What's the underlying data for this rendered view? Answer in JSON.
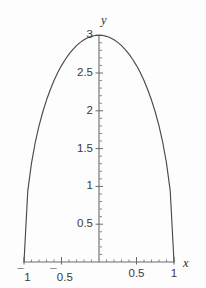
{
  "chart_data": {
    "type": "line",
    "title": "",
    "xlabel": "x",
    "ylabel": "y",
    "xlim": [
      -1,
      1
    ],
    "ylim": [
      0,
      3
    ],
    "grid": false,
    "legend": null,
    "equation": "y = 3*sqrt(1 - x^2)",
    "line_color": "#4a4a4a",
    "axis_color": "#6a6a6a",
    "background_color": "#fdfdfd",
    "x_ticks": [
      {
        "value": -1,
        "label": "1",
        "negative": true
      },
      {
        "value": -0.5,
        "label": "0.5",
        "negative": true
      },
      {
        "value": 0.5,
        "label": "0.5",
        "negative": false
      },
      {
        "value": 1,
        "label": "1",
        "negative": false
      }
    ],
    "y_ticks": [
      {
        "value": 0.5,
        "label": "0.5"
      },
      {
        "value": 1,
        "label": "1"
      },
      {
        "value": 1.5,
        "label": "1.5"
      },
      {
        "value": 2,
        "label": "2"
      },
      {
        "value": 2.5,
        "label": "2.5"
      },
      {
        "value": 3,
        "label": "3"
      }
    ],
    "x_minor_tick_step": 0.1,
    "y_minor_tick_step": 0.1,
    "points": [
      {
        "x": -1.0,
        "y": 0.0
      },
      {
        "x": -0.95,
        "y": 0.937
      },
      {
        "x": -0.9,
        "y": 1.308
      },
      {
        "x": -0.85,
        "y": 1.581
      },
      {
        "x": -0.8,
        "y": 1.8
      },
      {
        "x": -0.75,
        "y": 1.984
      },
      {
        "x": -0.7,
        "y": 2.142
      },
      {
        "x": -0.65,
        "y": 2.279
      },
      {
        "x": -0.6,
        "y": 2.4
      },
      {
        "x": -0.55,
        "y": 2.507
      },
      {
        "x": -0.5,
        "y": 2.598
      },
      {
        "x": -0.45,
        "y": 2.679
      },
      {
        "x": -0.4,
        "y": 2.749
      },
      {
        "x": -0.35,
        "y": 2.809
      },
      {
        "x": -0.3,
        "y": 2.862
      },
      {
        "x": -0.25,
        "y": 2.905
      },
      {
        "x": -0.2,
        "y": 2.939
      },
      {
        "x": -0.15,
        "y": 2.966
      },
      {
        "x": -0.1,
        "y": 2.985
      },
      {
        "x": -0.05,
        "y": 2.996
      },
      {
        "x": 0.0,
        "y": 3.0
      },
      {
        "x": 0.05,
        "y": 2.996
      },
      {
        "x": 0.1,
        "y": 2.985
      },
      {
        "x": 0.15,
        "y": 2.966
      },
      {
        "x": 0.2,
        "y": 2.939
      },
      {
        "x": 0.25,
        "y": 2.905
      },
      {
        "x": 0.3,
        "y": 2.862
      },
      {
        "x": 0.35,
        "y": 2.809
      },
      {
        "x": 0.4,
        "y": 2.749
      },
      {
        "x": 0.45,
        "y": 2.679
      },
      {
        "x": 0.5,
        "y": 2.598
      },
      {
        "x": 0.55,
        "y": 2.507
      },
      {
        "x": 0.6,
        "y": 2.4
      },
      {
        "x": 0.65,
        "y": 2.279
      },
      {
        "x": 0.7,
        "y": 2.142
      },
      {
        "x": 0.75,
        "y": 1.984
      },
      {
        "x": 0.8,
        "y": 1.8
      },
      {
        "x": 0.85,
        "y": 1.581
      },
      {
        "x": 0.9,
        "y": 1.308
      },
      {
        "x": 0.95,
        "y": 0.937
      },
      {
        "x": 1.0,
        "y": 0.0
      }
    ]
  },
  "axes": {
    "x_name": "x",
    "y_name": "y"
  },
  "negative_sign_glyph": "¯"
}
